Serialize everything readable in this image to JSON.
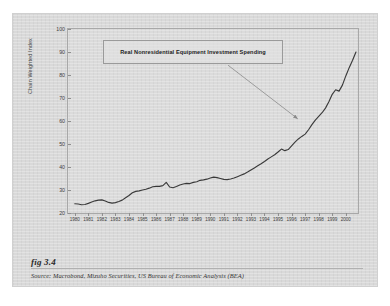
{
  "figure": {
    "caption": "fig 3.4",
    "source": "Source:  Macrobond, Mizuho Securities, US Bureau of Economic Analysis (BEA)"
  },
  "annotation": {
    "text": "Real Nonresidential Equipment Investment Spending"
  },
  "colors": {
    "page": "#d9d9d9",
    "line": "#3a3a3a",
    "border": "#a8a8a8",
    "annotation_border": "#9a9a9a",
    "arrow": "#8a8a8a"
  },
  "chart_data": {
    "type": "line",
    "title": "",
    "subtitle": "",
    "xlabel": "",
    "ylabel": "Chain Weighted Index",
    "ylim": [
      20,
      100
    ],
    "yticks": [
      20,
      30,
      40,
      50,
      60,
      70,
      80,
      90,
      100
    ],
    "xlim": [
      1979.5,
      2000.9
    ],
    "xticks": [
      1980,
      1981,
      1982,
      1983,
      1984,
      1985,
      1986,
      1987,
      1988,
      1989,
      1990,
      1991,
      1992,
      1993,
      1994,
      1995,
      1996,
      1997,
      1998,
      1999,
      2000
    ],
    "grid": false,
    "legend": null,
    "annotations": [
      {
        "text": "Real Nonresidential Equipment Investment Spending",
        "arrow_from": [
          1991.3,
          84
        ],
        "arrow_to": [
          1996.4,
          61
        ]
      }
    ],
    "series": [
      {
        "name": "Real Nonresidential Equipment Investment Spending",
        "x": [
          1980.0,
          1980.25,
          1980.5,
          1980.75,
          1981.0,
          1981.25,
          1981.5,
          1981.75,
          1982.0,
          1982.25,
          1982.5,
          1982.75,
          1983.0,
          1983.25,
          1983.5,
          1983.75,
          1984.0,
          1984.25,
          1984.5,
          1984.75,
          1985.0,
          1985.25,
          1985.5,
          1985.75,
          1986.0,
          1986.25,
          1986.5,
          1986.75,
          1987.0,
          1987.25,
          1987.5,
          1987.75,
          1988.0,
          1988.25,
          1988.5,
          1988.75,
          1989.0,
          1989.25,
          1989.5,
          1989.75,
          1990.0,
          1990.25,
          1990.5,
          1990.75,
          1991.0,
          1991.25,
          1991.5,
          1991.75,
          1992.0,
          1992.25,
          1992.5,
          1992.75,
          1993.0,
          1993.25,
          1993.5,
          1993.75,
          1994.0,
          1994.25,
          1994.5,
          1994.75,
          1995.0,
          1995.25,
          1995.5,
          1995.75,
          1996.0,
          1996.25,
          1996.5,
          1996.75,
          1997.0,
          1997.25,
          1997.5,
          1997.75,
          1998.0,
          1998.25,
          1998.5,
          1998.75,
          1999.0,
          1999.25,
          1999.5,
          1999.75,
          2000.0,
          2000.25,
          2000.5,
          2000.75
        ],
        "y": [
          24.0,
          23.9,
          23.6,
          23.7,
          24.2,
          24.8,
          25.3,
          25.6,
          25.7,
          25.2,
          24.6,
          24.3,
          24.5,
          25.0,
          25.6,
          26.6,
          27.6,
          28.8,
          29.4,
          29.6,
          30.0,
          30.3,
          30.8,
          31.4,
          31.6,
          31.6,
          31.9,
          33.3,
          31.3,
          31.0,
          31.5,
          32.2,
          32.6,
          32.9,
          32.8,
          33.3,
          33.6,
          34.2,
          34.4,
          34.7,
          35.2,
          35.6,
          35.4,
          35.0,
          34.6,
          34.5,
          34.8,
          35.2,
          35.8,
          36.4,
          37.0,
          37.8,
          38.7,
          39.6,
          40.5,
          41.4,
          42.4,
          43.5,
          44.4,
          45.3,
          46.5,
          47.8,
          47.1,
          47.6,
          49.2,
          50.8,
          52.2,
          53.3,
          54.3,
          56.2,
          58.4,
          60.4,
          62.0,
          63.6,
          65.6,
          68.4,
          71.6,
          73.6,
          73.0,
          75.6,
          79.6,
          83.2,
          86.4,
          90.0
        ]
      }
    ]
  }
}
